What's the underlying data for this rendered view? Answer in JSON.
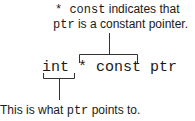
{
  "annotation_top": {
    "line1": {
      "code": "* const",
      "text": " indicates that"
    },
    "line2": {
      "code": "ptr",
      "text": " is a constant pointer."
    }
  },
  "code_line": {
    "type": "int",
    "qualifier": "* const",
    "name": "ptr"
  },
  "annotation_bottom": {
    "prefix": "This is what ",
    "code": "ptr",
    "suffix": " points to."
  },
  "colors": {
    "text": "#1a1a1a",
    "line": "#333333",
    "background": "#ffffff"
  }
}
